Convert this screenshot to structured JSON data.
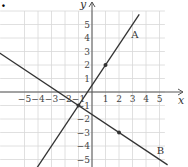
{
  "figure": {
    "marker": ".",
    "axes": {
      "x_label": "x",
      "y_label": "y",
      "x_ticks": [
        "−5",
        "−4",
        "−3",
        "−2",
        "−1",
        "1",
        "2",
        "3",
        "4",
        "5"
      ],
      "y_ticks": [
        "5",
        "4",
        "3",
        "2",
        "1",
        "−1",
        "−2",
        "−3",
        "−4",
        "−5"
      ]
    },
    "lines": [
      {
        "label": "A",
        "equation": "y = 1.5x + 0.5",
        "points": [
          [
            1,
            2
          ],
          [
            -1,
            -1
          ]
        ]
      },
      {
        "label": "B",
        "equation": "y = -2/3 x - 5/3",
        "points": [
          [
            2,
            -3
          ],
          [
            -1,
            -1
          ]
        ]
      }
    ],
    "colors": {
      "grid": "#d8d8d8",
      "axis": "#555555",
      "line": "#333333"
    }
  },
  "chart_data": {
    "type": "line",
    "title": "",
    "xlabel": "x",
    "ylabel": "y",
    "xlim": [
      -6.9,
      7
    ],
    "ylim": [
      -5.5,
      6.5
    ],
    "grid": true,
    "series": [
      {
        "name": "A",
        "points": [
          [
            -1,
            -1
          ],
          [
            1,
            2
          ]
        ],
        "marked_points": [
          [
            1,
            2
          ]
        ]
      },
      {
        "name": "B",
        "points": [
          [
            -1,
            -1
          ],
          [
            2,
            -3
          ]
        ],
        "marked_points": [
          [
            2,
            -3
          ]
        ]
      }
    ],
    "intersection": [
      -1,
      -1
    ]
  }
}
